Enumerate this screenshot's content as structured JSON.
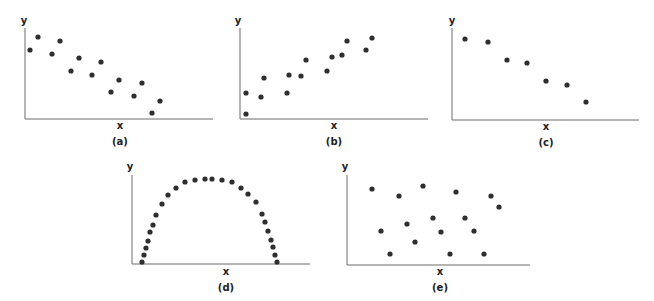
{
  "figure": {
    "panels": [
      {
        "id": "a",
        "label": "(a)",
        "xlabel": "x",
        "ylabel": "y"
      },
      {
        "id": "b",
        "label": "(b)",
        "xlabel": "x",
        "ylabel": "y"
      },
      {
        "id": "c",
        "label": "(c)",
        "xlabel": "x",
        "ylabel": "y"
      },
      {
        "id": "d",
        "label": "(d)",
        "xlabel": "x",
        "ylabel": "y"
      },
      {
        "id": "e",
        "label": "(e)",
        "xlabel": "x",
        "ylabel": "y"
      }
    ]
  },
  "chart_data": [
    {
      "type": "scatter",
      "title": "(a)",
      "xlabel": "x",
      "ylabel": "y",
      "pattern": "negative linear, moderate scatter",
      "points_px": [
        [
          30,
          50
        ],
        [
          38,
          37
        ],
        [
          52,
          54
        ],
        [
          60,
          41
        ],
        [
          71,
          71
        ],
        [
          79,
          58
        ],
        [
          92,
          75
        ],
        [
          101,
          62
        ],
        [
          111,
          92
        ],
        [
          119,
          80
        ],
        [
          134,
          96
        ],
        [
          142,
          83
        ],
        [
          152,
          113
        ],
        [
          160,
          101
        ]
      ]
    },
    {
      "type": "scatter",
      "title": "(b)",
      "xlabel": "x",
      "ylabel": "y",
      "pattern": "positive linear, moderate scatter",
      "points_px": [
        [
          246,
          114
        ],
        [
          246,
          93
        ],
        [
          261,
          97
        ],
        [
          264,
          78
        ],
        [
          287,
          93
        ],
        [
          289,
          75
        ],
        [
          301,
          76
        ],
        [
          306,
          60
        ],
        [
          327,
          71
        ],
        [
          332,
          57
        ],
        [
          342,
          55
        ],
        [
          347,
          41
        ],
        [
          366,
          50
        ],
        [
          372,
          38
        ]
      ]
    },
    {
      "type": "scatter",
      "title": "(c)",
      "xlabel": "x",
      "ylabel": "y",
      "pattern": "negative linear, strong",
      "points_px": [
        [
          465,
          39
        ],
        [
          488,
          42
        ],
        [
          507,
          60
        ],
        [
          527,
          63
        ],
        [
          546,
          81
        ],
        [
          567,
          85
        ],
        [
          586,
          102
        ]
      ]
    },
    {
      "type": "scatter",
      "title": "(d)",
      "xlabel": "x",
      "ylabel": "y",
      "pattern": "curvilinear (inverted U / arch)",
      "points_px": [
        [
          142,
          262
        ],
        [
          144,
          255
        ],
        [
          146,
          248
        ],
        [
          148,
          241
        ],
        [
          150,
          232
        ],
        [
          153,
          225
        ],
        [
          156,
          215
        ],
        [
          162,
          204
        ],
        [
          168,
          195
        ],
        [
          176,
          188
        ],
        [
          185,
          182
        ],
        [
          195,
          180
        ],
        [
          205,
          179
        ],
        [
          212,
          179
        ],
        [
          222,
          180
        ],
        [
          232,
          182
        ],
        [
          241,
          188
        ],
        [
          248,
          194
        ],
        [
          256,
          202
        ],
        [
          262,
          214
        ],
        [
          265,
          222
        ],
        [
          268,
          231
        ],
        [
          271,
          240
        ],
        [
          273,
          247
        ],
        [
          275,
          255
        ],
        [
          277,
          262
        ]
      ]
    },
    {
      "type": "scatter",
      "title": "(e)",
      "xlabel": "x",
      "ylabel": "y",
      "pattern": "no correlation",
      "points_px": [
        [
          372,
          189
        ],
        [
          399,
          196
        ],
        [
          423,
          186
        ],
        [
          456,
          192
        ],
        [
          491,
          196
        ],
        [
          499,
          207
        ],
        [
          381,
          231
        ],
        [
          407,
          224
        ],
        [
          433,
          218
        ],
        [
          441,
          232
        ],
        [
          465,
          218
        ],
        [
          474,
          231
        ],
        [
          415,
          242
        ],
        [
          390,
          254
        ],
        [
          450,
          254
        ],
        [
          484,
          254
        ]
      ]
    }
  ],
  "layout": {
    "axes": [
      {
        "id": "a",
        "x0": 25,
        "y0": 119,
        "xend": 213,
        "ytop": 28,
        "xlabel_pos": [
          120,
          129
        ],
        "label_pos": [
          120,
          145
        ],
        "ylabel_pos": [
          24,
          24
        ]
      },
      {
        "id": "b",
        "x0": 240,
        "y0": 119,
        "xend": 428,
        "ytop": 28,
        "xlabel_pos": [
          334,
          129
        ],
        "label_pos": [
          334,
          145
        ],
        "ylabel_pos": [
          238,
          24
        ]
      },
      {
        "id": "c",
        "x0": 452,
        "y0": 120,
        "xend": 639,
        "ytop": 28,
        "xlabel_pos": [
          546,
          130
        ],
        "label_pos": [
          546,
          146
        ],
        "ylabel_pos": [
          452,
          24
        ]
      },
      {
        "id": "d",
        "x0": 132,
        "y0": 264,
        "xend": 310,
        "ytop": 175,
        "xlabel_pos": [
          226,
          275
        ],
        "label_pos": [
          226,
          291
        ],
        "ylabel_pos": [
          130,
          170
        ]
      },
      {
        "id": "e",
        "x0": 347,
        "y0": 265,
        "xend": 530,
        "ytop": 175,
        "xlabel_pos": [
          440,
          275
        ],
        "label_pos": [
          440,
          291
        ],
        "ylabel_pos": [
          345,
          170
        ]
      }
    ],
    "dot_radius": 2.6,
    "dot_color": "#2e2e2e",
    "axis_color": "#6b6b6b"
  }
}
